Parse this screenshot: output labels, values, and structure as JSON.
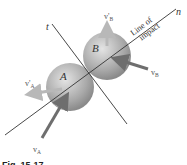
{
  "figure": {
    "caption": "Fig. 15-17",
    "axes": {
      "normal": "n",
      "tangent": "t"
    },
    "line_of_impact": {
      "line1": "Line of",
      "line2": "impact"
    },
    "bodies": {
      "a": "A",
      "b": "B"
    },
    "velocities": {
      "vA": "v",
      "vA_sub": "A",
      "vA_prime": "v'",
      "vA_prime_sub": "A",
      "vB": "v",
      "vB_sub": "B",
      "vB_prime": "v'",
      "vB_prime_sub": "B"
    },
    "colors": {
      "sphere_light": "#d9d9d9",
      "sphere_dark": "#8a8a8a",
      "arrow_dark": "#6e6e6e",
      "arrow_light": "#b8b8b8",
      "line": "#333333"
    }
  }
}
